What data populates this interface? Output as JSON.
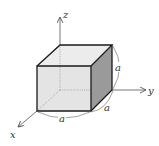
{
  "diagram": {
    "type": "cube-with-axes",
    "axes": {
      "x": {
        "label": "x"
      },
      "y": {
        "label": "y"
      },
      "z": {
        "label": "z"
      }
    },
    "edges": {
      "height_label": "a",
      "depth_label": "a",
      "width_label": "a"
    },
    "colors": {
      "front_face": "#e4e4e4",
      "top_face": "#ececec",
      "side_face": "#9a9a9a",
      "edge": "#1a1a1a",
      "axis": "#666666",
      "hidden": "#999999"
    }
  }
}
